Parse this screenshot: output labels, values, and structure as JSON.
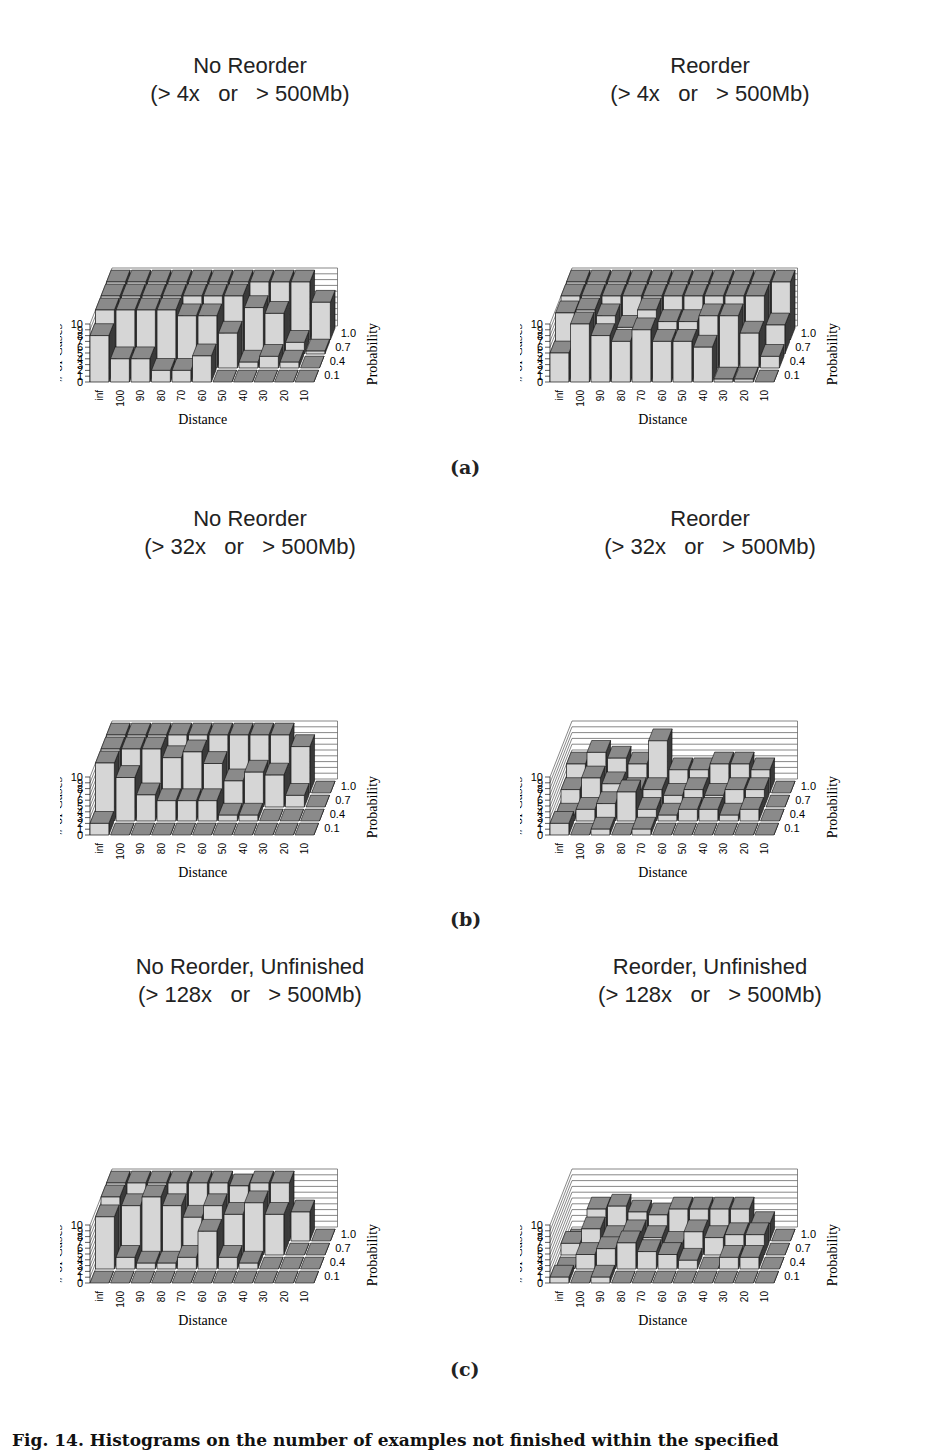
{
  "figure": {
    "panel_labels": [
      "(a)",
      "(b)",
      "(c)"
    ],
    "caption": "Fig. 14. Histograms on the number of examples not finished within the specified"
  },
  "axes": {
    "x_label": "Distance",
    "y_label": "# of Cases",
    "z_label": "Probability",
    "x_ticks": [
      "inf",
      "100",
      "90",
      "80",
      "70",
      "60",
      "50",
      "40",
      "30",
      "20",
      "10"
    ],
    "y_ticks": [
      "0",
      "1",
      "2",
      "3",
      "4",
      "5",
      "6",
      "7",
      "8",
      "9",
      "10"
    ],
    "z_ticks": [
      "0.1",
      "0.4",
      "0.7",
      "1.0"
    ]
  },
  "colors": {
    "bar_front": "#d6d6d6",
    "bar_top": "#8a8a8a",
    "bar_side": "#3a3a3a",
    "grid": "#555555"
  },
  "chart_data": [
    {
      "id": "a-left",
      "type": "bar3d",
      "title": "No Reorder",
      "subtitle": "(> 4x   or   > 500Mb)",
      "xlabel": "Distance",
      "ylabel": "# of Cases",
      "zlabel": "Probability",
      "categories": [
        "inf",
        "100",
        "90",
        "80",
        "70",
        "60",
        "50",
        "40",
        "30",
        "20",
        "10"
      ],
      "depth_categories": [
        "0.1",
        "0.4",
        "0.7",
        "1.0"
      ],
      "ylim": [
        0,
        10
      ],
      "series": [
        {
          "name": "0.1",
          "values": [
            8,
            4,
            4,
            2,
            2,
            4.5,
            0,
            0,
            0,
            0,
            0
          ]
        },
        {
          "name": "0.4",
          "values": [
            10,
            10,
            10,
            10,
            9,
            9,
            6,
            1,
            2,
            1,
            0
          ]
        },
        {
          "name": "0.7",
          "values": [
            10,
            10,
            10,
            10,
            10,
            10,
            10,
            8,
            7,
            2,
            0.5
          ]
        },
        {
          "name": "1.0",
          "values": [
            10,
            10,
            10,
            10,
            10,
            10,
            10,
            10,
            10,
            10,
            6.5
          ]
        }
      ]
    },
    {
      "id": "a-right",
      "type": "bar3d",
      "title": "Reorder",
      "subtitle": "(> 4x   or   > 500Mb)",
      "xlabel": "Distance",
      "ylabel": "# of Cases",
      "zlabel": "Probability",
      "categories": [
        "inf",
        "100",
        "90",
        "80",
        "70",
        "60",
        "50",
        "40",
        "30",
        "20",
        "10"
      ],
      "depth_categories": [
        "0.1",
        "0.4",
        "0.7",
        "1.0"
      ],
      "ylim": [
        0,
        10
      ],
      "series": [
        {
          "name": "0.1",
          "values": [
            5,
            10,
            8,
            7,
            9,
            7,
            7,
            6,
            0.5,
            0.5,
            0
          ]
        },
        {
          "name": "0.4",
          "values": [
            9.5,
            10,
            9,
            7,
            10,
            8,
            8,
            9,
            9,
            6,
            2
          ]
        },
        {
          "name": "0.7",
          "values": [
            10,
            10,
            10,
            10,
            10,
            10,
            10,
            10,
            10,
            10,
            5
          ]
        },
        {
          "name": "1.0",
          "values": [
            10,
            10,
            10,
            10,
            10,
            10,
            10,
            10,
            10,
            10,
            10
          ]
        }
      ]
    },
    {
      "id": "b-left",
      "type": "bar3d",
      "title": "No Reorder",
      "subtitle": "(> 32x   or   > 500Mb)",
      "xlabel": "Distance",
      "ylabel": "# of Cases",
      "zlabel": "Probability",
      "categories": [
        "inf",
        "100",
        "90",
        "80",
        "70",
        "60",
        "50",
        "40",
        "30",
        "20",
        "10"
      ],
      "depth_categories": [
        "0.1",
        "0.4",
        "0.7",
        "1.0"
      ],
      "ylim": [
        0,
        10
      ],
      "series": [
        {
          "name": "0.1",
          "values": [
            2,
            0,
            0,
            0,
            0,
            0,
            0,
            0,
            0,
            0,
            0
          ]
        },
        {
          "name": "0.4",
          "values": [
            10,
            7.5,
            4.5,
            3.5,
            3.5,
            3.5,
            1,
            1,
            0,
            0,
            0
          ]
        },
        {
          "name": "0.7",
          "values": [
            10,
            10,
            10,
            8.5,
            9.5,
            7.5,
            4.5,
            6,
            5.5,
            2,
            0
          ]
        },
        {
          "name": "1.0",
          "values": [
            10,
            10,
            10,
            10,
            10,
            10,
            10,
            10,
            10,
            8,
            0
          ]
        }
      ]
    },
    {
      "id": "b-right",
      "type": "bar3d",
      "title": "Reorder",
      "subtitle": "(> 32x   or   > 500Mb)",
      "xlabel": "Distance",
      "ylabel": "# of Cases",
      "zlabel": "Probability",
      "categories": [
        "inf",
        "100",
        "90",
        "80",
        "70",
        "60",
        "50",
        "40",
        "30",
        "20",
        "10"
      ],
      "depth_categories": [
        "0.1",
        "0.4",
        "0.7",
        "1.0"
      ],
      "ylim": [
        0,
        10
      ],
      "series": [
        {
          "name": "0.1",
          "values": [
            2,
            0,
            1,
            0,
            1,
            0,
            0,
            0,
            0,
            0,
            0
          ]
        },
        {
          "name": "0.4",
          "values": [
            1,
            2,
            3,
            5,
            2,
            1,
            2,
            2,
            1,
            2,
            0
          ]
        },
        {
          "name": "0.7",
          "values": [
            3,
            5,
            4,
            3,
            3,
            2,
            3,
            2,
            3,
            3,
            0
          ]
        },
        {
          "name": "1.0",
          "values": [
            5,
            7,
            6,
            5,
            9,
            4,
            4,
            5,
            5,
            4,
            0
          ]
        }
      ]
    },
    {
      "id": "c-left",
      "type": "bar3d",
      "title": "No Reorder, Unfinished",
      "subtitle": "(> 128x   or   > 500Mb)",
      "xlabel": "Distance",
      "ylabel": "# of Cases",
      "zlabel": "Probability",
      "categories": [
        "inf",
        "100",
        "90",
        "80",
        "70",
        "60",
        "50",
        "40",
        "30",
        "20",
        "10"
      ],
      "depth_categories": [
        "0.1",
        "0.4",
        "0.7",
        "1.0"
      ],
      "ylim": [
        0,
        10
      ],
      "series": [
        {
          "name": "0.1",
          "values": [
            0,
            0,
            0,
            0,
            0,
            0,
            0,
            0,
            0,
            0,
            0
          ]
        },
        {
          "name": "0.4",
          "values": [
            9,
            2,
            1,
            1,
            2,
            6.5,
            2,
            1,
            0,
            0,
            0
          ]
        },
        {
          "name": "0.7",
          "values": [
            10,
            8.5,
            10,
            8.5,
            6.5,
            8.5,
            7,
            9,
            7,
            0,
            0
          ]
        },
        {
          "name": "1.0",
          "values": [
            10,
            10,
            10,
            10,
            10,
            10,
            9.5,
            10,
            10,
            5,
            0
          ]
        }
      ]
    },
    {
      "id": "c-right",
      "type": "bar3d",
      "title": "Reorder, Unfinished",
      "subtitle": "(> 128x   or   > 500Mb)",
      "xlabel": "Distance",
      "ylabel": "# of Cases",
      "zlabel": "Probability",
      "categories": [
        "inf",
        "100",
        "90",
        "80",
        "70",
        "60",
        "50",
        "40",
        "30",
        "20",
        "10"
      ],
      "depth_categories": [
        "0.1",
        "0.4",
        "0.7",
        "1.0"
      ],
      "ylim": [
        0,
        10
      ],
      "series": [
        {
          "name": "0.1",
          "values": [
            1,
            0,
            1,
            0,
            0,
            0,
            0,
            0,
            0,
            0,
            0
          ]
        },
        {
          "name": "0.4",
          "values": [
            0,
            2.5,
            3.5,
            4.5,
            3,
            2.5,
            1.5,
            0,
            2,
            2,
            0
          ]
        },
        {
          "name": "0.7",
          "values": [
            2,
            4.5,
            3,
            4,
            3,
            2,
            4,
            3,
            3.5,
            3.5,
            0
          ]
        },
        {
          "name": "1.0",
          "values": [
            0,
            5.5,
            6,
            5,
            4.5,
            5.5,
            5.5,
            5.5,
            5.5,
            3,
            0
          ]
        }
      ]
    }
  ]
}
